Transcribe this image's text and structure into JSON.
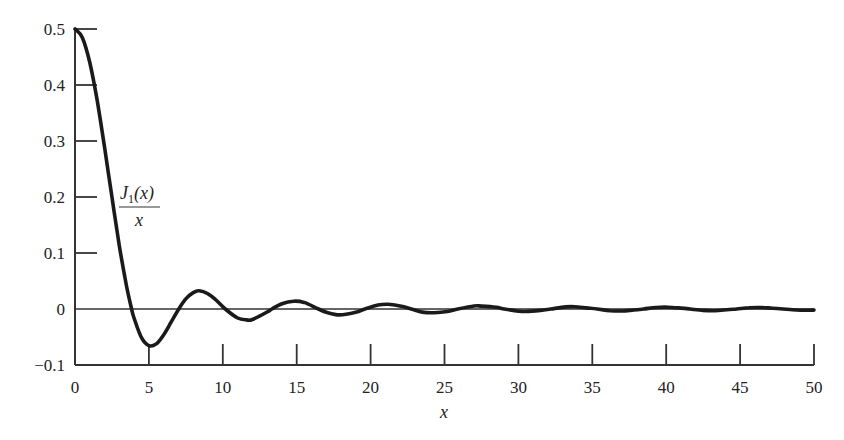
{
  "chart_data": {
    "type": "line",
    "title": "",
    "xlabel": "x",
    "ylabel": "",
    "xlim": [
      0,
      50
    ],
    "ylim": [
      -0.1,
      0.5
    ],
    "grid": false,
    "legend": null,
    "annotations": [
      {
        "text_numerator": "J1(x)",
        "text_denominator": "x",
        "position": "near x=3.5, y=0.22"
      }
    ],
    "x_ticks": [
      0,
      5,
      10,
      15,
      20,
      25,
      30,
      35,
      40,
      45,
      50
    ],
    "x_tick_labels": [
      "0",
      "5",
      "10",
      "15",
      "20",
      "25",
      "30",
      "35",
      "40",
      "45",
      "50"
    ],
    "y_ticks": [
      -0.1,
      0,
      0.1,
      0.2,
      0.3,
      0.4,
      0.5
    ],
    "y_tick_labels": [
      "−0.1",
      "0",
      "0.1",
      "0.2",
      "0.3",
      "0.4",
      "0.5"
    ],
    "zero_reference_line": true,
    "series": [
      {
        "name": "J1(x)/x",
        "x": [
          0,
          0.5,
          1,
          1.5,
          2,
          2.5,
          3,
          3.5,
          3.83,
          4,
          4.5,
          5,
          5.5,
          6,
          6.5,
          7.02,
          7.5,
          8,
          8.4,
          9,
          9.5,
          10.17,
          11,
          11.6,
          12,
          13,
          13.32,
          14,
          14.8,
          15.5,
          16.47,
          17,
          17.9,
          19,
          19.62,
          20.5,
          21.2,
          22,
          22.76,
          23.5,
          24.3,
          25.2,
          25.9,
          27,
          27.5,
          28.5,
          29.05,
          30,
          30.5,
          31.5,
          32.19,
          33.2,
          33.8,
          34.6,
          35.33,
          36.2,
          37.0,
          37.8,
          38.47,
          39.3,
          40.1,
          41.0,
          41.62,
          42.5,
          43.3,
          44.1,
          44.76,
          45.6,
          46.4,
          47.2,
          47.9,
          48.8,
          49.5,
          50
        ],
        "values": [
          0.5,
          0.4845,
          0.4401,
          0.3725,
          0.2884,
          0.1994,
          0.113,
          0.0392,
          0.0,
          -0.0166,
          -0.0513,
          -0.0655,
          -0.0623,
          -0.046,
          -0.0235,
          0.0,
          0.0181,
          0.0293,
          0.0326,
          0.0272,
          0.017,
          0.0,
          -0.0161,
          -0.0195,
          -0.0187,
          -0.0054,
          0.0,
          0.0095,
          0.0139,
          0.0117,
          0.0,
          -0.0057,
          -0.0106,
          -0.0058,
          0.0,
          0.0071,
          0.0085,
          0.0052,
          0.0,
          -0.0055,
          -0.0066,
          -0.0045,
          0.0,
          0.0054,
          0.0052,
          0.003,
          0.0,
          -0.0039,
          -0.0045,
          -0.0025,
          0.0,
          0.0038,
          0.0041,
          0.002,
          0.0,
          -0.003,
          -0.0036,
          -0.0018,
          0.0,
          0.0026,
          0.0032,
          0.0016,
          0.0,
          -0.0025,
          -0.003,
          -0.0015,
          0.0,
          0.0022,
          0.0027,
          0.0014,
          0.0,
          -0.0018,
          -0.0022,
          -0.002
        ]
      }
    ]
  },
  "labels": {
    "xlabel": "x",
    "func_numerator": "J",
    "func_subscript": "1",
    "func_numerator_rest": "(x)",
    "func_denominator": "x"
  }
}
